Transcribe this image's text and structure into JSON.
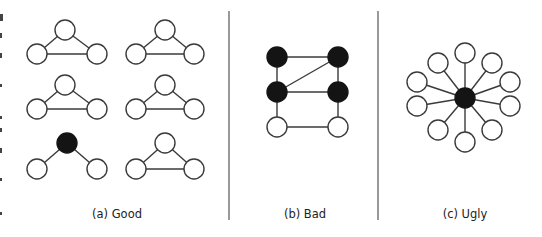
{
  "figure": {
    "panels": [
      {
        "id": "a",
        "caption": "(a) Good",
        "caption_x": 117,
        "graphs": [
          {
            "nodes": [
              {
                "x": 65,
                "y": 30,
                "filled": false
              },
              {
                "x": 37,
                "y": 54,
                "filled": false
              },
              {
                "x": 97,
                "y": 54,
                "filled": false
              }
            ],
            "edges": [
              [
                0,
                1
              ],
              [
                0,
                2
              ],
              [
                1,
                2
              ]
            ]
          },
          {
            "nodes": [
              {
                "x": 165,
                "y": 30,
                "filled": false
              },
              {
                "x": 136,
                "y": 54,
                "filled": false
              },
              {
                "x": 194,
                "y": 54,
                "filled": false
              }
            ],
            "edges": [
              [
                0,
                1
              ],
              [
                0,
                2
              ],
              [
                1,
                2
              ]
            ]
          },
          {
            "nodes": [
              {
                "x": 65,
                "y": 85,
                "filled": false
              },
              {
                "x": 37,
                "y": 109,
                "filled": false
              },
              {
                "x": 97,
                "y": 109,
                "filled": false
              }
            ],
            "edges": [
              [
                0,
                1
              ],
              [
                0,
                2
              ],
              [
                1,
                2
              ]
            ]
          },
          {
            "nodes": [
              {
                "x": 165,
                "y": 85,
                "filled": false
              },
              {
                "x": 136,
                "y": 109,
                "filled": false
              },
              {
                "x": 194,
                "y": 109,
                "filled": false
              }
            ],
            "edges": [
              [
                0,
                1
              ],
              [
                0,
                2
              ],
              [
                1,
                2
              ]
            ]
          },
          {
            "nodes": [
              {
                "x": 67,
                "y": 143,
                "filled": true
              },
              {
                "x": 37,
                "y": 169,
                "filled": false
              },
              {
                "x": 97,
                "y": 169,
                "filled": false
              }
            ],
            "edges": [
              [
                0,
                1
              ],
              [
                0,
                2
              ]
            ]
          },
          {
            "nodes": [
              {
                "x": 165,
                "y": 143,
                "filled": false
              },
              {
                "x": 136,
                "y": 169,
                "filled": false
              },
              {
                "x": 194,
                "y": 169,
                "filled": false
              }
            ],
            "edges": [
              [
                0,
                1
              ],
              [
                0,
                2
              ],
              [
                1,
                2
              ]
            ]
          }
        ]
      },
      {
        "id": "b",
        "caption": "(b) Bad",
        "caption_x": 305,
        "graphs": [
          {
            "nodes": [
              {
                "x": 277,
                "y": 57,
                "filled": true
              },
              {
                "x": 338,
                "y": 57,
                "filled": true
              },
              {
                "x": 277,
                "y": 92,
                "filled": true
              },
              {
                "x": 338,
                "y": 92,
                "filled": true
              },
              {
                "x": 277,
                "y": 127,
                "filled": false
              },
              {
                "x": 338,
                "y": 127,
                "filled": false
              }
            ],
            "edges": [
              [
                0,
                1
              ],
              [
                0,
                2
              ],
              [
                1,
                3
              ],
              [
                1,
                2
              ],
              [
                2,
                3
              ],
              [
                2,
                4
              ],
              [
                3,
                5
              ],
              [
                4,
                5
              ]
            ]
          }
        ]
      },
      {
        "id": "c",
        "caption": "(c) Ugly",
        "caption_x": 465,
        "graphs": [
          {
            "nodes": [
              {
                "x": 465,
                "y": 98,
                "filled": true
              },
              {
                "x": 465,
                "y": 53,
                "filled": false
              },
              {
                "x": 438,
                "y": 63,
                "filled": false
              },
              {
                "x": 492,
                "y": 63,
                "filled": false
              },
              {
                "x": 417,
                "y": 82,
                "filled": false
              },
              {
                "x": 510,
                "y": 82,
                "filled": false
              },
              {
                "x": 417,
                "y": 106,
                "filled": false
              },
              {
                "x": 510,
                "y": 106,
                "filled": false
              },
              {
                "x": 438,
                "y": 130,
                "filled": false
              },
              {
                "x": 492,
                "y": 130,
                "filled": false
              },
              {
                "x": 465,
                "y": 142,
                "filled": false
              }
            ],
            "edges": [
              [
                0,
                1
              ],
              [
                0,
                2
              ],
              [
                0,
                3
              ],
              [
                0,
                4
              ],
              [
                0,
                5
              ],
              [
                0,
                6
              ],
              [
                0,
                7
              ],
              [
                0,
                8
              ],
              [
                0,
                9
              ],
              [
                0,
                10
              ]
            ]
          }
        ]
      }
    ],
    "dividers": [
      {
        "x": 229,
        "y1": 11,
        "y2": 220
      },
      {
        "x": 378,
        "y1": 11,
        "y2": 220
      }
    ],
    "node_radius": 10,
    "caption_y": 218,
    "colors": {
      "edge": "#3a3a3a",
      "filled_node": "#141414",
      "open_node": "#ffffff"
    }
  }
}
